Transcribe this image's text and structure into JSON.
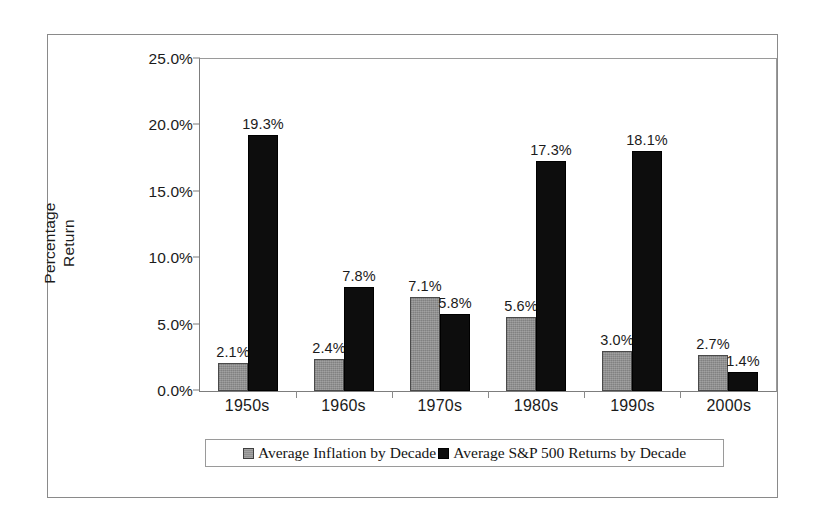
{
  "chart_data": {
    "type": "bar",
    "title": "",
    "xlabel": "",
    "ylabel": "Percentage\nReturn",
    "categories": [
      "1950s",
      "1960s",
      "1970s",
      "1980s",
      "1990s",
      "2000s"
    ],
    "series": [
      {
        "name": "Average Inflation by Decade",
        "color": "#8f8f8f",
        "values": [
          2.1,
          2.4,
          7.1,
          5.6,
          3.0,
          2.7
        ],
        "labels": [
          "2.1%",
          "2.4%",
          "7.1%",
          "5.6%",
          "3.0%",
          "2.7%"
        ]
      },
      {
        "name": "Average S&P 500 Returns by Decade",
        "color": "#0d0d0d",
        "values": [
          19.3,
          7.8,
          5.8,
          17.3,
          18.1,
          1.4
        ],
        "labels": [
          "19.3%",
          "7.8%",
          "5.8%",
          "17.3%",
          "18.1%",
          "1.4%"
        ]
      }
    ],
    "ylim": [
      0,
      25
    ],
    "ytick_values": [
      0,
      5,
      10,
      15,
      20,
      25
    ],
    "ytick_labels": [
      "0.0%",
      "5.0%",
      "10.0%",
      "15.0%",
      "20.0%",
      "25.0%"
    ],
    "grid": false,
    "legend_position": "bottom"
  },
  "axis": {
    "y_title_line1": "Percentage",
    "y_title_line2": "Return"
  },
  "legend": {
    "entries": [
      {
        "label": "Average Inflation  by Decade",
        "swatch": "inflation-swatch"
      },
      {
        "label": "Average S&P 500 Returns by Decade",
        "swatch": "sp500-swatch"
      }
    ]
  }
}
